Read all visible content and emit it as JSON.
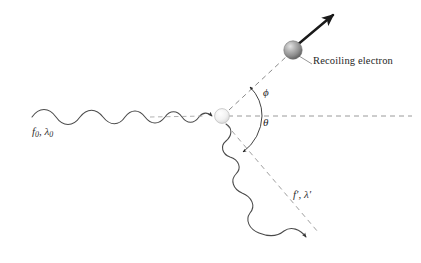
{
  "figure": {
    "background_color": "#ffffff",
    "width": 421,
    "height": 263
  },
  "labels": {
    "recoiling_electron": "Recoiling electron",
    "incident_photon": "f0, λ0",
    "incident_photon_parts": {
      "symbol1": "f",
      "sub1": "0",
      "sep": ", ",
      "symbol2": "λ",
      "sub2": "0"
    },
    "scattered_photon": "f′, λ′",
    "scattered_photon_parts": {
      "symbol1": "f′",
      "sep": ", ",
      "symbol2": "λ′"
    },
    "angle_phi": "ϕ",
    "angle_theta": "θ"
  },
  "elements": {
    "incident_wave": {
      "name": "incident-photon-wave",
      "description": "sinusoidal wave travelling left to right with decreasing wavelength, terminating in arrowhead at scattering vertex"
    },
    "scattering_vertex": {
      "name": "scattering-vertex",
      "description": "small pale circle where the photon strikes the electron",
      "color": "#efefef"
    },
    "recoil_electron_sphere": {
      "name": "recoiling-electron-sphere",
      "description": "shaded gray sphere with highlight",
      "color": "#8d8d8d"
    },
    "recoil_momentum_arrow": {
      "name": "recoil-momentum-arrow",
      "description": "thick dark arrow from electron pointing up-right",
      "color": "#1a1a1a"
    },
    "electron_path": {
      "name": "electron-trajectory-dashed",
      "description": "dashed line from vertex to electron at angle phi",
      "color": "#8a8a8a"
    },
    "reference_axis": {
      "name": "horizontal-reference-axis",
      "description": "gray dashed horizontal line through the vertex",
      "color": "#9a9a9a"
    },
    "scattered_wave": {
      "name": "scattered-photon-wave",
      "description": "sinusoidal wave leaving vertex down-right at angle theta, ending in arrowhead",
      "color": "#4a4a4a"
    },
    "scattered_path": {
      "name": "scattered-photon-dashed-path",
      "description": "dashed guide line along the scattered photon direction",
      "color": "#9a9a9a"
    },
    "phi_arc": {
      "name": "phi-angle-arc",
      "description": "arc with arrowhead measuring phi above the axis"
    },
    "theta_arc": {
      "name": "theta-angle-arc",
      "description": "arc with arrowhead measuring theta below the axis"
    },
    "leader_line": {
      "name": "recoiling-electron-leader-line",
      "description": "thin gray line connecting sphere to its text label",
      "color": "#8a8a8a"
    }
  },
  "colors": {
    "background": "#ffffff",
    "wave_stroke": "#4a4a4a",
    "dashed_stroke": "#9a9a9a",
    "arrow_dark": "#1a1a1a",
    "sphere_gray": "#8d8d8d",
    "vertex_pale": "#efefef",
    "text": "#262626"
  },
  "geometry": {
    "vertex": {
      "x": 222,
      "y": 116
    },
    "electron_center": {
      "x": 293,
      "y": 50
    },
    "phi_degrees": 43,
    "theta_degrees": 62
  }
}
